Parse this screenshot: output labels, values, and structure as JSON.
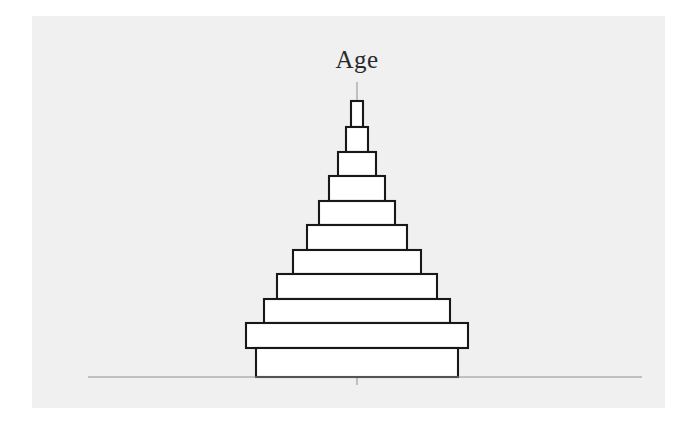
{
  "figure": {
    "background_color": "#ffffff",
    "plot_background_color": "#f0f0f0",
    "width": 698,
    "height": 424
  },
  "title": {
    "text": "Age",
    "color": "#2b2b2b",
    "x": 357,
    "y": 68
  },
  "axes": {
    "center_axis": {
      "x": 357,
      "y_top": 82,
      "y_bottom": 385,
      "color": "#9a9a9a"
    },
    "baseline": {
      "x_left": 88,
      "x_right": 642,
      "y": 377,
      "color": "#8f8f8f"
    }
  },
  "chart_data": {
    "type": "bar",
    "title": "Age",
    "xlabel": "",
    "ylabel": "Age",
    "orientation": "horizontal-centered",
    "grid": false,
    "legend": null,
    "center_x": 357,
    "bar_fill_color": "#ffffff",
    "bar_stroke_color": "#181818",
    "bar_stroke_width": 2.1,
    "categories": [
      "band-11-oldest",
      "band-10",
      "band-9",
      "band-8",
      "band-7",
      "band-6",
      "band-5",
      "band-4",
      "band-3",
      "band-2",
      "band-1-youngest"
    ],
    "values": [
      12,
      22,
      38,
      56,
      76,
      100,
      128,
      160,
      186,
      222,
      202
    ],
    "bars": [
      {
        "name": "band-11-oldest",
        "half_width": 6,
        "y_top": 101,
        "y_bottom": 127,
        "height": 26
      },
      {
        "name": "band-10",
        "half_width": 11,
        "y_top": 127,
        "y_bottom": 152,
        "height": 25
      },
      {
        "name": "band-9",
        "half_width": 19,
        "y_top": 152,
        "y_bottom": 176,
        "height": 24
      },
      {
        "name": "band-8",
        "half_width": 28,
        "y_top": 176,
        "y_bottom": 201,
        "height": 25
      },
      {
        "name": "band-7",
        "half_width": 38,
        "y_top": 201,
        "y_bottom": 225,
        "height": 24
      },
      {
        "name": "band-6",
        "half_width": 50,
        "y_top": 225,
        "y_bottom": 250,
        "height": 25
      },
      {
        "name": "band-5",
        "half_width": 64,
        "y_top": 250,
        "y_bottom": 274,
        "height": 24
      },
      {
        "name": "band-4",
        "half_width": 80,
        "y_top": 274,
        "y_bottom": 299,
        "height": 25
      },
      {
        "name": "band-3",
        "half_width": 93,
        "y_top": 299,
        "y_bottom": 323,
        "height": 24
      },
      {
        "name": "band-2",
        "half_width": 111,
        "y_top": 323,
        "y_bottom": 348,
        "height": 25
      },
      {
        "name": "band-1-youngest",
        "half_width": 101,
        "y_top": 348,
        "y_bottom": 377,
        "height": 29
      }
    ],
    "xlim": [
      -120,
      120
    ],
    "ylim": [
      101,
      377
    ]
  }
}
